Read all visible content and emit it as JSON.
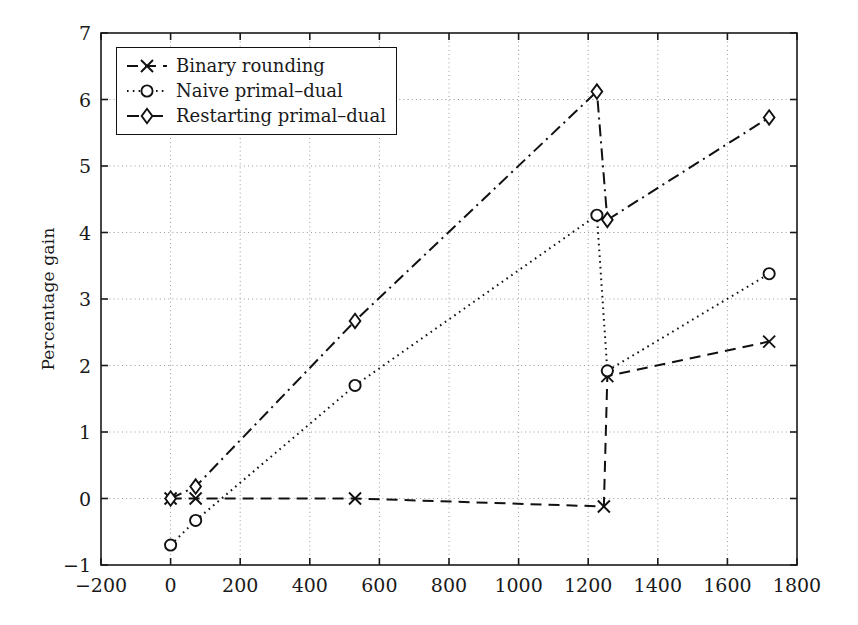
{
  "chart_data": {
    "type": "line",
    "title": "",
    "xlabel": "",
    "ylabel": "Percentage gain",
    "xlim": [
      -200,
      1800
    ],
    "ylim": [
      -1,
      7
    ],
    "xticks": [
      -200,
      0,
      200,
      400,
      600,
      800,
      1000,
      1200,
      1400,
      1600,
      1800
    ],
    "yticks": [
      -1,
      0,
      1,
      2,
      3,
      4,
      5,
      6,
      7
    ],
    "xtick_labels": [
      "−200",
      "0",
      "200",
      "400",
      "600",
      "800",
      "1000",
      "1200",
      "1400",
      "1600",
      "1800"
    ],
    "ytick_labels": [
      "−1",
      "0",
      "1",
      "2",
      "3",
      "4",
      "5",
      "6",
      "7"
    ],
    "grid": true,
    "grid_style": "dotted",
    "grid_color": "#9a9a9a",
    "legend_position": "upper-left",
    "series": [
      {
        "name": "Binary rounding",
        "marker": "x",
        "line_style": "dashed",
        "color": "#111111",
        "points": [
          {
            "x": 0,
            "y": 0.0
          },
          {
            "x": 72,
            "y": 0.0
          },
          {
            "x": 530,
            "y": 0.0
          },
          {
            "x": 1245,
            "y": -0.12
          },
          {
            "x": 1255,
            "y": 1.84
          },
          {
            "x": 1720,
            "y": 2.36
          }
        ]
      },
      {
        "name": "Naive primal–dual",
        "marker": "o",
        "line_style": "dotted",
        "color": "#111111",
        "points": [
          {
            "x": 0,
            "y": -0.7
          },
          {
            "x": 72,
            "y": -0.33
          },
          {
            "x": 530,
            "y": 1.7
          },
          {
            "x": 1225,
            "y": 4.26
          },
          {
            "x": 1255,
            "y": 1.92
          },
          {
            "x": 1720,
            "y": 3.38
          }
        ]
      },
      {
        "name": "Restarting primal–dual",
        "marker": "d",
        "line_style": "dash-dot",
        "color": "#111111",
        "points": [
          {
            "x": 0,
            "y": 0.0
          },
          {
            "x": 72,
            "y": 0.18
          },
          {
            "x": 530,
            "y": 2.67
          },
          {
            "x": 1225,
            "y": 6.12
          },
          {
            "x": 1255,
            "y": 4.19
          },
          {
            "x": 1720,
            "y": 5.73
          }
        ]
      }
    ]
  },
  "legend": {
    "items": [
      {
        "label": "Binary rounding"
      },
      {
        "label": "Naive primal–dual"
      },
      {
        "label": "Restarting primal–dual"
      }
    ]
  },
  "axes": {
    "y_axis_title": "Percentage gain"
  }
}
